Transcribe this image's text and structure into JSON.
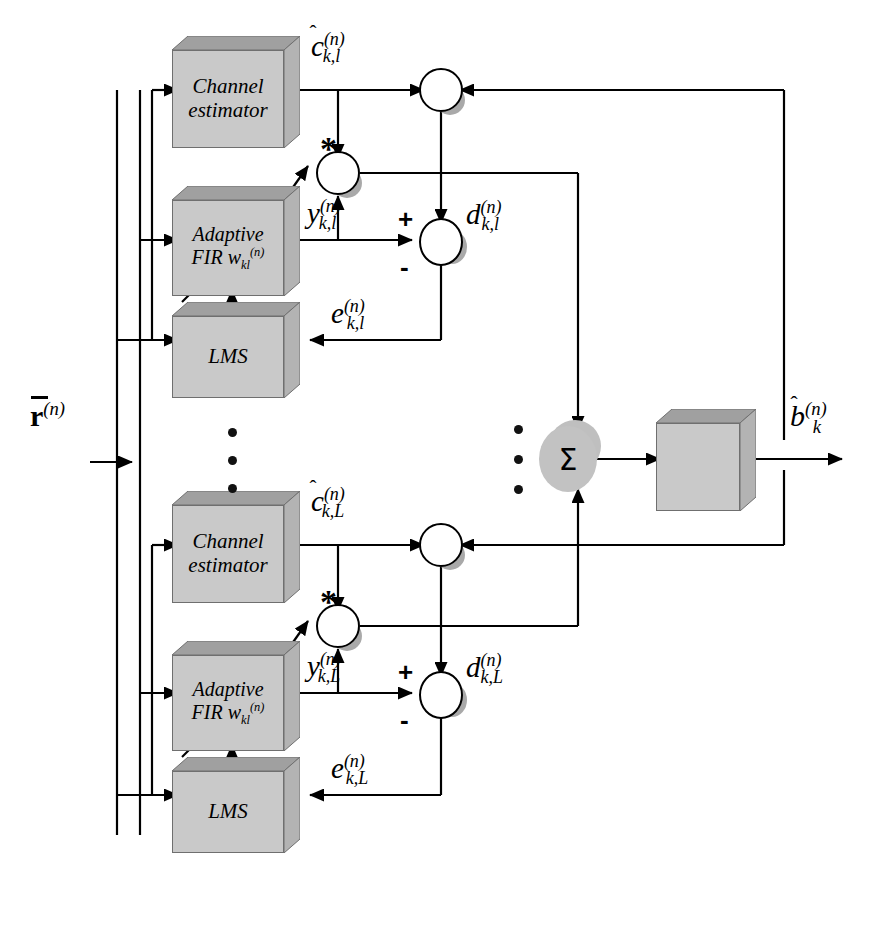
{
  "figure": {
    "type": "block-diagram",
    "background_color": "#ffffff",
    "box_face_color": "#c9c9c9",
    "box_top_color": "#a0a0a0",
    "shadow_color": "#a9a9a9",
    "line_color": "#000000"
  },
  "input": {
    "label_r": "r",
    "label_r_sup": "(n)",
    "name": "received-signal-vector"
  },
  "output": {
    "label_b": "b",
    "label_b_sub": "k",
    "label_b_sup": "(n)",
    "name": "detected-bit-estimate"
  },
  "branches": [
    {
      "id": "finger-l",
      "channel_estimator": {
        "line1": "Channel",
        "line2": "estimator"
      },
      "adaptive_fir": {
        "line1": "Adaptive",
        "line2_a": "FIR w",
        "line2_sub": "kl",
        "line2_sup": "(n)"
      },
      "lms": {
        "label": "LMS"
      },
      "signals": {
        "channel_estimate": {
          "base": "c",
          "sub": "k,l",
          "sup": "(n)",
          "hat": true
        },
        "filter_output": {
          "base": "y",
          "sub": "k,l",
          "sup": "(n)",
          "hat": false
        },
        "decision_input": {
          "base": "d",
          "sub": "k,l",
          "sup": "(n)",
          "hat": false
        },
        "error": {
          "base": "e",
          "sub": "k,l",
          "sup": "(n)",
          "hat": false
        }
      },
      "conjugate_symbol": "*",
      "adder_signs": {
        "positive": "+",
        "negative": "-"
      },
      "multiplier_symbol": "cross-multiplier-icon"
    },
    {
      "id": "finger-L",
      "channel_estimator": {
        "line1": "Channel",
        "line2": "estimator"
      },
      "adaptive_fir": {
        "line1": "Adaptive",
        "line2_a": "FIR w",
        "line2_sub": "kl",
        "line2_sup": "(n)"
      },
      "lms": {
        "label": "LMS"
      },
      "signals": {
        "channel_estimate": {
          "base": "c",
          "sub": "k,L",
          "sup": "(n)",
          "hat": true
        },
        "filter_output": {
          "base": "y",
          "sub": "k,L",
          "sup": "(n)",
          "hat": false
        },
        "decision_input": {
          "base": "d",
          "sub": "k,L",
          "sup": "(n)",
          "hat": false
        },
        "error": {
          "base": "e",
          "sub": "k,L",
          "sup": "(n)",
          "hat": false
        }
      },
      "conjugate_symbol": "*",
      "adder_signs": {
        "positive": "+",
        "negative": "-"
      },
      "multiplier_symbol": "cross-multiplier-icon"
    }
  ],
  "combiner": {
    "symbol": "Σ",
    "name": "summation-node"
  },
  "decision_device": {
    "symbol": "signum-step-function",
    "name": "decision-device"
  },
  "ellipsis": {
    "left_dots": 3,
    "combiner_dots": 3,
    "glyph": "•"
  }
}
